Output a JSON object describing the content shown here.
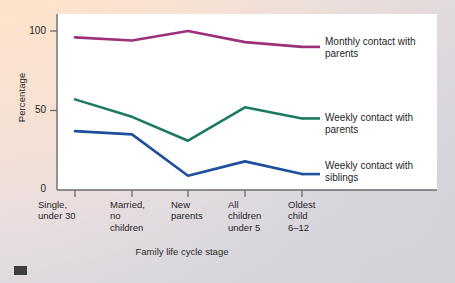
{
  "chart_data": {
    "type": "line",
    "title": "",
    "xlabel": "Family life cycle stage",
    "ylabel": "Percentage",
    "categories": [
      "Single,\nunder 30",
      "Married,\nno\nchildren",
      "New\nparents",
      "All\nchildren\nunder 5",
      "Oldest\nchild\n6–12"
    ],
    "ylim": [
      0,
      110
    ],
    "yticks": [
      0,
      50,
      100
    ],
    "ytick_labels": [
      "0",
      "50",
      "100"
    ],
    "grid": false,
    "legend_position": "right",
    "series": [
      {
        "name": "Monthly contact with\nparents",
        "color": "#9c3179",
        "values": [
          96,
          94,
          100,
          93,
          90
        ]
      },
      {
        "name": "Weekly contact with\nparents",
        "color": "#1c7a63",
        "values": [
          57,
          46,
          31,
          52,
          45
        ]
      },
      {
        "name": "Weekly contact with\nsiblings",
        "color": "#1f4f9c",
        "values": [
          37,
          35,
          9,
          18,
          10
        ]
      }
    ]
  },
  "colors": {
    "monthly_parents": "#9c3179",
    "weekly_parents": "#1c7a63",
    "weekly_siblings": "#1f4f9c",
    "axis": "#6b6b6b",
    "plot_background": "#ffffff",
    "page_background": "#f3ddc9"
  }
}
